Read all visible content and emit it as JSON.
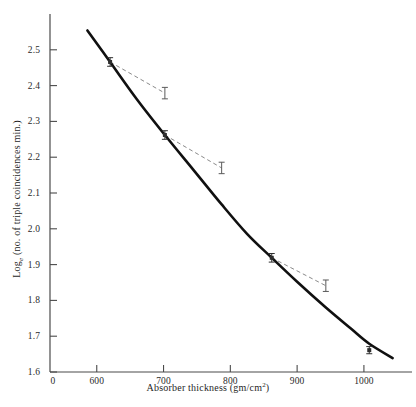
{
  "chart_data": {
    "type": "line",
    "title": "",
    "xlabel": "Absorber thickness (gm/cm²)",
    "xlabel_main": "Absorber  thickness  (gm/cm",
    "xlabel_sup": "2",
    "xlabel_tail": ")",
    "ylabel": "Log_e (no. of triple coincidences min.)",
    "ylabel_lead": "Log",
    "ylabel_sub": "e",
    "ylabel_tail": " (no. of triple coincidences min.)",
    "xlim": [
      530,
      1072
    ],
    "ylim": [
      1.6,
      2.6
    ],
    "xticks": [
      600,
      700,
      800,
      900,
      1000
    ],
    "xtick_labels": [
      "600",
      "700",
      "800",
      "900",
      "1000"
    ],
    "yticks": [
      1.6,
      1.7,
      1.8,
      1.9,
      2.0,
      2.1,
      2.2,
      2.3,
      2.4,
      2.5
    ],
    "ytick_labels": [
      "1.6",
      "1.7",
      "1.8",
      "1.9",
      "2.0",
      "2.1",
      "2.2",
      "2.3",
      "2.4",
      "2.5"
    ],
    "origin_label": "0",
    "grid": false,
    "legend": "none",
    "series": [
      {
        "name": "fitted curve",
        "style": "solid",
        "color": "#101010",
        "linewidth": 2.6,
        "points": [
          [
            586,
            2.554
          ],
          [
            620,
            2.466
          ],
          [
            660,
            2.362
          ],
          [
            702,
            2.262
          ],
          [
            745,
            2.164
          ],
          [
            787,
            2.068
          ],
          [
            825,
            1.986
          ],
          [
            862,
            1.919
          ],
          [
            900,
            1.852
          ],
          [
            943,
            1.78
          ],
          [
            980,
            1.722
          ],
          [
            1008,
            1.679
          ],
          [
            1043,
            1.639
          ]
        ]
      },
      {
        "name": "corrected points (dashed connectors)",
        "style": "dashed",
        "color": "#8a8a8a",
        "linewidth": 1,
        "connectors": [
          {
            "from": [
              620,
              2.466
            ],
            "to": [
              702,
              2.379
            ]
          },
          {
            "from": [
              702,
              2.262
            ],
            "to": [
              787,
              2.17
            ]
          },
          {
            "from": [
              862,
              1.919
            ],
            "to": [
              943,
              1.841
            ]
          }
        ]
      }
    ],
    "data_points": [
      {
        "x": 620,
        "y": 2.466,
        "on_curve": true,
        "yerr": 0.012
      },
      {
        "x": 702,
        "y": 2.262,
        "on_curve": true,
        "yerr": 0.012
      },
      {
        "x": 862,
        "y": 1.919,
        "on_curve": true,
        "yerr": 0.012
      },
      {
        "x": 1008,
        "y": 1.661,
        "on_curve": true,
        "yerr": 0.01
      },
      {
        "x": 702,
        "y": 2.379,
        "on_curve": false,
        "yerr": 0.016
      },
      {
        "x": 787,
        "y": 2.17,
        "on_curve": false,
        "yerr": 0.016
      },
      {
        "x": 943,
        "y": 1.841,
        "on_curve": false,
        "yerr": 0.016
      }
    ],
    "annotations": []
  },
  "axes": {
    "line_color": "#4a4a4a",
    "tick_color": "#4a4a4a"
  }
}
